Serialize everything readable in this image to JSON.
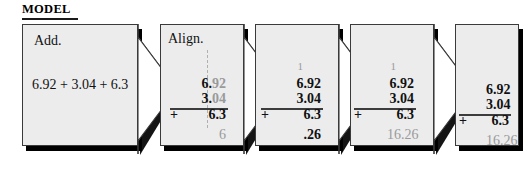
{
  "heading": {
    "label": "MODEL"
  },
  "panels": [
    {
      "id": "panel-instruction",
      "caption": "Add.",
      "expression": "6.92 + 3.04 + 6.3",
      "shape": "arrow"
    },
    {
      "id": "panel-align",
      "caption": "Align.",
      "shape": "arrow",
      "carry": "",
      "addend1_int": "6.",
      "addend1_dec": "92",
      "addend2_int": "3.",
      "addend2_dec": "04",
      "addend3_sign": "+",
      "addend3_int": "6.",
      "addend3_dec": "3",
      "sum": ".",
      "sum_extra": "6",
      "sum_color": "gray",
      "has_dashline": true
    },
    {
      "id": "panel-add-hundredths",
      "caption": "",
      "shape": "arrow",
      "carry": "1",
      "addend1": "6.92",
      "addend2": "3.04",
      "addend3_sign": "+",
      "addend3": "6.3",
      "sum": ".26",
      "sum_color": "black"
    },
    {
      "id": "panel-add-total",
      "caption": "",
      "shape": "arrow",
      "carry": "1",
      "addend1": "6.92",
      "addend2": "3.04",
      "addend3_sign": "+",
      "addend3": "6.3",
      "sum": "16.26",
      "sum_color": "gray"
    },
    {
      "id": "panel-answer",
      "caption": "",
      "shape": "rect",
      "carry": "",
      "addend1": "6.92",
      "addend2": "3.04",
      "addend3_sign": "+",
      "addend3": "6.3",
      "sum": "16.26",
      "sum_color": "gray"
    }
  ],
  "colors": {
    "panel_face": "#ececed",
    "panel_border": "#3a3a3a",
    "shadow": "#000000",
    "ink": "#111111",
    "ghost": "#9a9a9a",
    "page": "#ffffff"
  }
}
